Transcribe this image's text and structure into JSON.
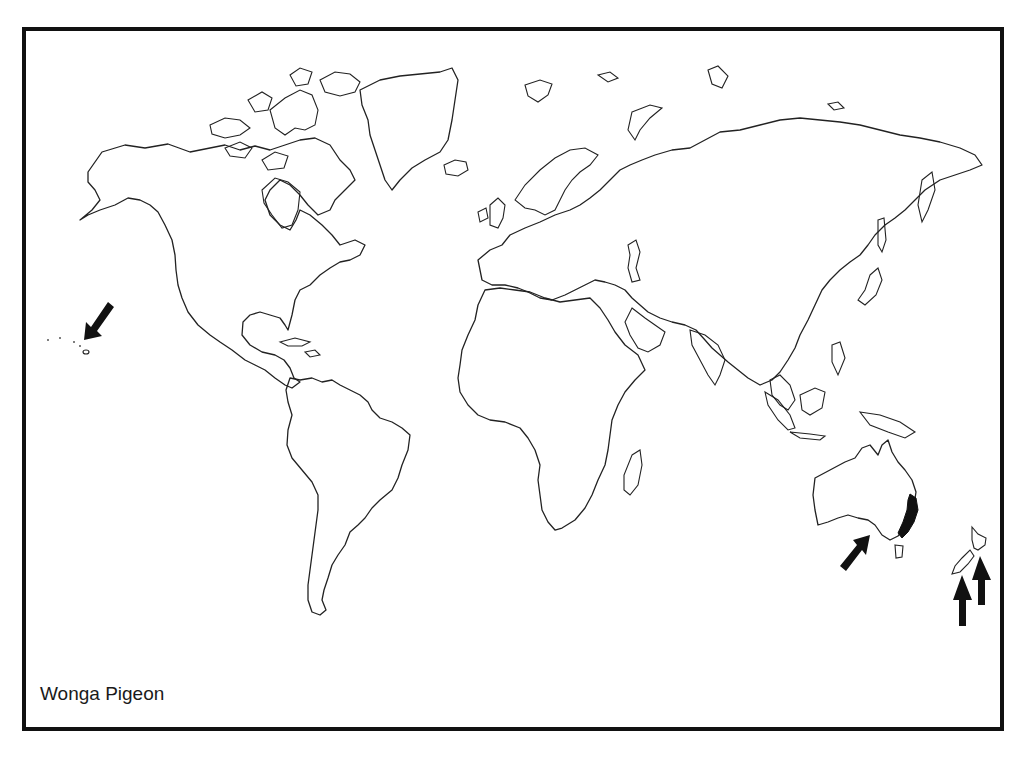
{
  "map": {
    "title": "Wonga Pigeon",
    "type": "world outline distribution map",
    "colors": {
      "outline": "#222222",
      "range_fill": "#111111",
      "border": "#111111",
      "background": "#ffffff"
    },
    "distribution": {
      "native_range": "Eastern Australia (coastal strip, Queensland to Victoria)",
      "arrows": [
        {
          "id": "hawaii",
          "target": "Hawaiian Islands",
          "direction": "down-left"
        },
        {
          "id": "south-australia",
          "target": "Southern Australia (Adelaide region)",
          "direction": "up-right"
        },
        {
          "id": "nz-south",
          "target": "New Zealand South Island",
          "direction": "up"
        },
        {
          "id": "nz-north",
          "target": "New Zealand North Island",
          "direction": "up"
        }
      ]
    }
  }
}
